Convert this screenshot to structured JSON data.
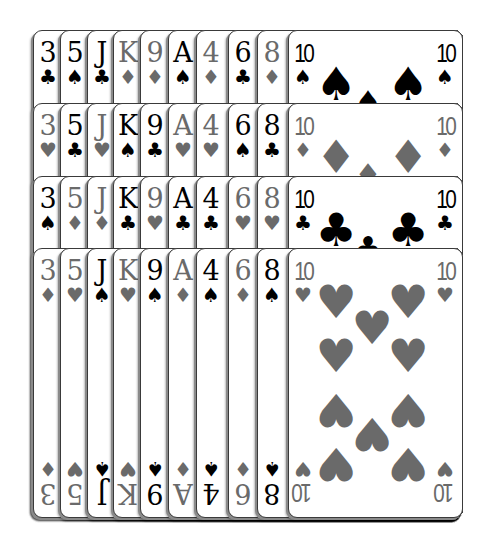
{
  "game": {
    "title": "Solitaire tableau",
    "colors": {
      "red_suit": "#6a6a6a",
      "black_suit": "#000000",
      "card_bg": "#ffffff",
      "card_border": "#3a3a3a"
    }
  },
  "columns": [
    {
      "left": 33
    },
    {
      "left": 60
    },
    {
      "left": 87
    },
    {
      "left": 113
    },
    {
      "left": 140
    },
    {
      "left": 168
    },
    {
      "left": 196
    },
    {
      "left": 228
    },
    {
      "left": 257
    },
    {
      "left": 288
    }
  ],
  "rows": [
    {
      "top": 30,
      "cards": [
        {
          "rank": "3",
          "suit": "♣",
          "color": "black"
        },
        {
          "rank": "5",
          "suit": "♠",
          "color": "black"
        },
        {
          "rank": "J",
          "suit": "♣",
          "color": "black"
        },
        {
          "rank": "K",
          "suit": "♦",
          "color": "red"
        },
        {
          "rank": "9",
          "suit": "♦",
          "color": "red"
        },
        {
          "rank": "A",
          "suit": "♠",
          "color": "black"
        },
        {
          "rank": "4",
          "suit": "♦",
          "color": "red"
        },
        {
          "rank": "6",
          "suit": "♣",
          "color": "black"
        },
        {
          "rank": "8",
          "suit": "♦",
          "color": "red"
        },
        {
          "rank": "10",
          "suit": "♠",
          "color": "black"
        }
      ]
    },
    {
      "top": 103,
      "cards": [
        {
          "rank": "3",
          "suit": "♥",
          "color": "red"
        },
        {
          "rank": "5",
          "suit": "♣",
          "color": "black"
        },
        {
          "rank": "J",
          "suit": "♥",
          "color": "red"
        },
        {
          "rank": "K",
          "suit": "♠",
          "color": "black"
        },
        {
          "rank": "9",
          "suit": "♣",
          "color": "black"
        },
        {
          "rank": "A",
          "suit": "♥",
          "color": "red"
        },
        {
          "rank": "4",
          "suit": "♥",
          "color": "red"
        },
        {
          "rank": "6",
          "suit": "♠",
          "color": "black"
        },
        {
          "rank": "8",
          "suit": "♣",
          "color": "black"
        },
        {
          "rank": "10",
          "suit": "♦",
          "color": "red"
        }
      ]
    },
    {
      "top": 176,
      "cards": [
        {
          "rank": "3",
          "suit": "♠",
          "color": "black"
        },
        {
          "rank": "5",
          "suit": "♦",
          "color": "red"
        },
        {
          "rank": "J",
          "suit": "♦",
          "color": "red"
        },
        {
          "rank": "K",
          "suit": "♣",
          "color": "black"
        },
        {
          "rank": "9",
          "suit": "♥",
          "color": "red"
        },
        {
          "rank": "A",
          "suit": "♣",
          "color": "black"
        },
        {
          "rank": "4",
          "suit": "♣",
          "color": "black"
        },
        {
          "rank": "6",
          "suit": "♥",
          "color": "red"
        },
        {
          "rank": "8",
          "suit": "♥",
          "color": "red"
        },
        {
          "rank": "10",
          "suit": "♣",
          "color": "black"
        }
      ]
    },
    {
      "top": 248,
      "cards": [
        {
          "rank": "3",
          "suit": "♦",
          "color": "red"
        },
        {
          "rank": "5",
          "suit": "♥",
          "color": "red"
        },
        {
          "rank": "J",
          "suit": "♠",
          "color": "black"
        },
        {
          "rank": "K",
          "suit": "♥",
          "color": "red"
        },
        {
          "rank": "9",
          "suit": "♠",
          "color": "black"
        },
        {
          "rank": "A",
          "suit": "♦",
          "color": "red"
        },
        {
          "rank": "4",
          "suit": "♠",
          "color": "black"
        },
        {
          "rank": "6",
          "suit": "♦",
          "color": "red"
        },
        {
          "rank": "8",
          "suit": "♠",
          "color": "black"
        },
        {
          "rank": "10",
          "suit": "♥",
          "color": "red"
        }
      ]
    }
  ],
  "bottom": 518,
  "right_edge": 463
}
